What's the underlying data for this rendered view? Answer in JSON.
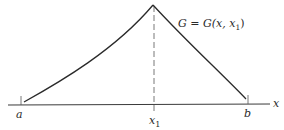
{
  "diagram": {
    "type": "green-function-plot",
    "axis": {
      "label": "x"
    },
    "ticks": [
      {
        "id": "a",
        "label": "a"
      },
      {
        "id": "x1",
        "label": "x",
        "sub": "1"
      },
      {
        "id": "b",
        "label": "b"
      }
    ],
    "curve_label": {
      "lhs": "G = G(x, x",
      "sub": "1",
      "rhs": ")"
    },
    "colors": {
      "line": "#2a2a2a",
      "background": "#ffffff"
    }
  }
}
